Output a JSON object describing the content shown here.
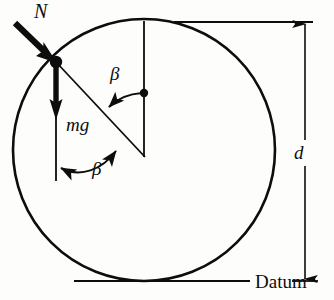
{
  "figure": {
    "kind": "free-body-diagram",
    "background_color": "#fdfdfb",
    "ink_color": "#0d0d0d"
  },
  "labels": {
    "normal_force": "N",
    "weight": "mg",
    "angle_upper": "β",
    "angle_lower": "β",
    "diameter": "d",
    "datum": "Datum"
  },
  "geometry": {
    "circle": {
      "center_x": 144,
      "center_y": 150,
      "radius": 131
    },
    "particle": {
      "x": 56,
      "y": 62
    },
    "center_dot": {
      "x": 144,
      "y": 93
    },
    "chord_end": {
      "x": 144,
      "y": 156
    },
    "vertical_axis": {
      "x": 144,
      "top_y": 22,
      "bottom_y": 156
    },
    "weight_line": {
      "x": 56,
      "top_y": 62,
      "arrow_y": 117,
      "bottom_y": 181
    },
    "normal_arrow": {
      "tail_x": 14,
      "tail_y": 22,
      "head_x": 56,
      "head_y": 62
    },
    "dimension_line": {
      "x": 305,
      "top_y": 22,
      "bottom_y": 281
    },
    "top_datum_line": {
      "x1": 174,
      "x2": 313,
      "y": 22
    },
    "bottom_datum_line_left": {
      "x1": 74,
      "x2": 253,
      "y": 281
    },
    "bottom_datum_line_right": {
      "x1": 292,
      "x2": 318,
      "y": 281
    }
  },
  "label_positions": {
    "normal_force": {
      "x": 34,
      "y": 16
    },
    "weight": {
      "x": 68,
      "y": 130
    },
    "angle_upper": {
      "x": 110,
      "y": 78
    },
    "angle_lower": {
      "x": 92,
      "y": 172
    },
    "diameter": {
      "x": 298,
      "y": 158
    },
    "datum": {
      "x": 258,
      "y": 287
    }
  }
}
